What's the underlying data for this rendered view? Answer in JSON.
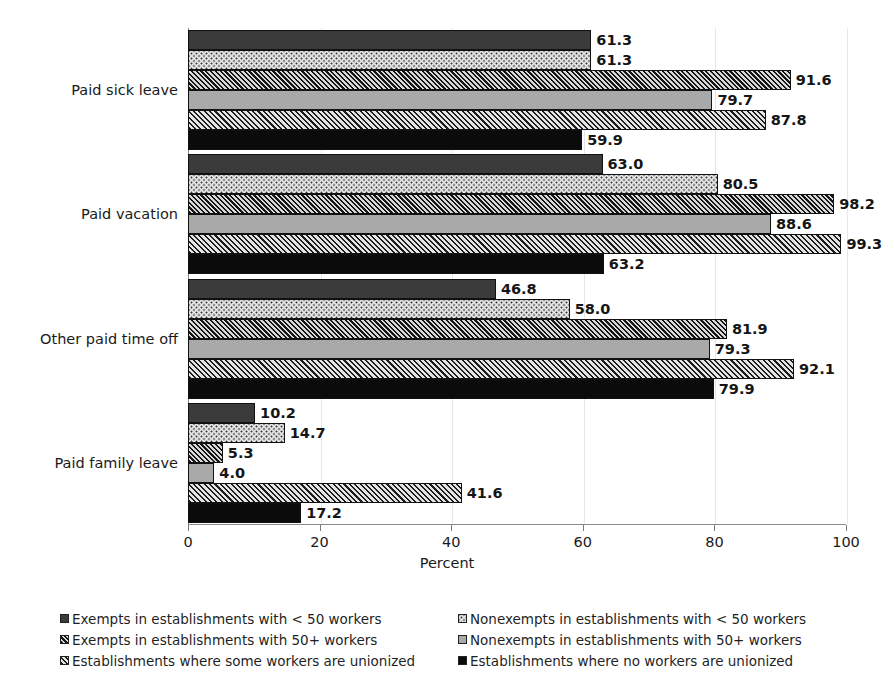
{
  "chart_data": {
    "type": "bar",
    "orientation": "horizontal",
    "title": "",
    "xlabel": "Percent",
    "ylabel": "",
    "xlim": [
      0,
      100
    ],
    "xticks": [
      0,
      20,
      40,
      60,
      80,
      100
    ],
    "grid": "vertical-light",
    "legend_position": "bottom",
    "legend_columns": 2,
    "categories": [
      "Paid sick leave",
      "Paid vacation",
      "Other paid time off",
      "Paid family leave"
    ],
    "series": [
      {
        "name": "Exempts in establishments with < 50 workers",
        "pattern": "solid-dark-gray",
        "color": "#3b3b3b",
        "values": [
          61.3,
          63.0,
          46.8,
          10.2
        ],
        "labels": [
          "61.3",
          "63.0",
          "46.8",
          "10.2"
        ]
      },
      {
        "name": "Nonexempts in establishments with < 50 workers",
        "pattern": "dotted-light",
        "color": "#e9e9e9",
        "values": [
          61.3,
          80.5,
          58.0,
          14.7
        ],
        "labels": [
          "61.3",
          "80.5",
          "58.0",
          "14.7"
        ]
      },
      {
        "name": "Exempts in establishments with 50+ workers",
        "pattern": "diagonal-hatch-dark",
        "color": "#5d5d5d",
        "values": [
          91.6,
          98.2,
          81.9,
          5.3
        ],
        "labels": [
          "91.6",
          "98.2",
          "81.9",
          "5.3"
        ]
      },
      {
        "name": "Nonexempts in establishments with 50+ workers",
        "pattern": "solid-mid-gray",
        "color": "#a9a9a9",
        "values": [
          79.7,
          88.6,
          79.3,
          4.0
        ],
        "labels": [
          "79.7",
          "88.6",
          "79.3",
          "4.0"
        ]
      },
      {
        "name": "Establishments where some workers are unionized",
        "pattern": "diagonal-hatch-light",
        "color": "#6e6e6e",
        "values": [
          87.8,
          99.3,
          92.1,
          41.6
        ],
        "labels": [
          "87.8",
          "99.3",
          "92.1",
          "41.6"
        ]
      },
      {
        "name": "Establishments where no workers are unionized",
        "pattern": "solid-black",
        "color": "#0b0b0b",
        "values": [
          59.9,
          63.2,
          79.9,
          17.2
        ],
        "labels": [
          "59.9",
          "63.2",
          "79.9",
          "17.2"
        ]
      }
    ]
  },
  "axis": {
    "x_title": "Percent",
    "tick_labels": [
      "0",
      "20",
      "40",
      "60",
      "80",
      "100"
    ]
  },
  "legend": {
    "left_column": [
      "Exempts in establishments with < 50 workers",
      "Exempts in establishments with 50+ workers",
      "Establishments where some workers are unionized"
    ],
    "right_column": [
      "Nonexempts in establishments with < 50 workers",
      "Nonexempts in establishments with 50+ workers",
      "Establishments where no workers are unionized"
    ]
  }
}
